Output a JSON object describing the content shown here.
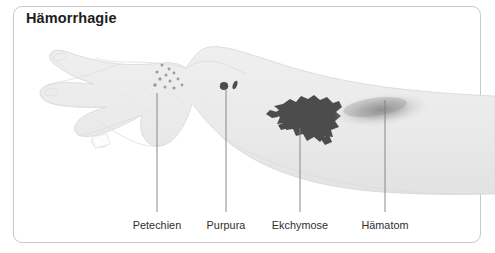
{
  "figure": {
    "title": "Hämorrhagie",
    "border_color": "#c9c9c9",
    "background_color": "#ffffff"
  },
  "illustration": {
    "subject": "hand-and-forearm-outline",
    "skin_fill_color": "#ebebeb",
    "skin_outline_color": "#d8d8d8",
    "lesion_color": "#4a4a4a",
    "petechiae_color": "#9a9a9a",
    "hematoma_color": "#9b9b9b",
    "leader_line_color": "#7a7a7a"
  },
  "annotations": [
    {
      "label": "Petechien",
      "lesion": "petechiae",
      "description": "cluster of small pinpoint dots",
      "dot_count": 12,
      "line_x": 157,
      "line_top": 93,
      "line_bottom": 212,
      "label_x": 157
    },
    {
      "label": "Purpura",
      "lesion": "purpura",
      "description": "two small dark spots",
      "dot_count": 2,
      "line_x": 226,
      "line_top": 88,
      "line_bottom": 212,
      "label_x": 226
    },
    {
      "label": "Ekchymose",
      "lesion": "ecchymosis",
      "description": "irregular dark patch",
      "line_x": 300,
      "line_top": 126,
      "line_bottom": 212,
      "label_x": 300
    },
    {
      "label": "Hämatom",
      "lesion": "hematoma",
      "description": "diffuse soft-edged shaded swelling",
      "line_x": 385,
      "line_top": 98,
      "line_bottom": 212,
      "label_x": 385
    }
  ]
}
